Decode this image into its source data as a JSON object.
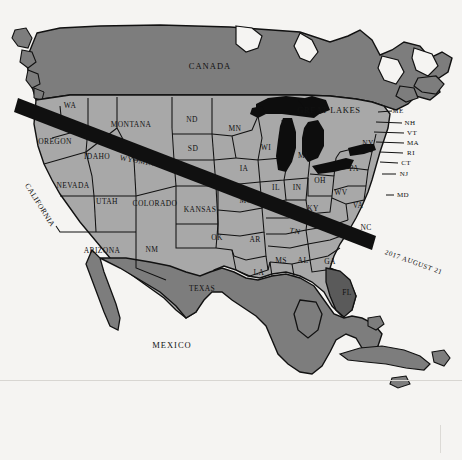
{
  "map": {
    "title": "Total Solar Eclipse Path Across North America",
    "eclipse_path_label": "2017 AUGUST 21",
    "colors": {
      "background": "#f7f6f4",
      "ocean": "#f5f4f2",
      "united_states": "#a8a8a8",
      "canada": "#7d7d7d",
      "mexico": "#7d7d7d",
      "cuba": "#7d7d7d",
      "florida_highlight": "#5a5a5a",
      "great_lakes": "#0d0d0d",
      "eclipse_band": "#101010",
      "border": "#111111",
      "label_text": "#111111"
    },
    "countries": [
      {
        "name": "canada",
        "label": "CANADA"
      },
      {
        "name": "mexico",
        "label": "MEXICO"
      }
    ],
    "features": [
      {
        "name": "great-lakes",
        "label": "GREAT LAKES"
      }
    ],
    "states": [
      {
        "code": "WA",
        "label": "WA",
        "x": 70,
        "y": 105,
        "size": "med"
      },
      {
        "code": "OREGON",
        "label": "OREGON",
        "x": 55,
        "y": 141,
        "size": "med"
      },
      {
        "code": "CALIFORNIA",
        "label": "CALIFORNIA",
        "x": 40,
        "y": 205,
        "size": "med"
      },
      {
        "code": "NEVADA",
        "label": "NEVADA",
        "x": 73,
        "y": 185,
        "size": "med"
      },
      {
        "code": "IDAHO",
        "label": "IDAHO",
        "x": 97,
        "y": 156,
        "size": "med"
      },
      {
        "code": "MONTANA",
        "label": "MONTANA",
        "x": 131,
        "y": 124,
        "size": "med"
      },
      {
        "code": "WYOMING",
        "label": "WYOMING",
        "x": 140,
        "y": 161,
        "size": "med"
      },
      {
        "code": "UTAH",
        "label": "UTAH",
        "x": 107,
        "y": 201,
        "size": "med"
      },
      {
        "code": "COLORADO",
        "label": "COLORADO",
        "x": 155,
        "y": 203,
        "size": "med"
      },
      {
        "code": "ARIZONA",
        "label": "ARIZONA",
        "x": 102,
        "y": 250,
        "size": "med"
      },
      {
        "code": "NM",
        "label": "NM",
        "x": 152,
        "y": 249,
        "size": "med"
      },
      {
        "code": "TEXAS",
        "label": "TEXAS",
        "x": 202,
        "y": 288,
        "size": "med"
      },
      {
        "code": "ND",
        "label": "ND",
        "x": 192,
        "y": 119,
        "size": "med"
      },
      {
        "code": "SD",
        "label": "SD",
        "x": 193,
        "y": 148,
        "size": "med"
      },
      {
        "code": "NEBRASKA",
        "label": "NEBRASKA",
        "x": 196,
        "y": 175,
        "size": "med"
      },
      {
        "code": "KANSAS",
        "label": "KANSAS",
        "x": 200,
        "y": 209,
        "size": "med"
      },
      {
        "code": "OK",
        "label": "OK",
        "x": 217,
        "y": 237,
        "size": "med"
      },
      {
        "code": "MN",
        "label": "MN",
        "x": 235,
        "y": 128,
        "size": "med"
      },
      {
        "code": "IA",
        "label": "IA",
        "x": 244,
        "y": 168,
        "size": "med"
      },
      {
        "code": "MO",
        "label": "MO",
        "x": 246,
        "y": 200,
        "size": "med"
      },
      {
        "code": "AR",
        "label": "AR",
        "x": 255,
        "y": 239,
        "size": "med"
      },
      {
        "code": "LA",
        "label": "LA",
        "x": 259,
        "y": 272,
        "size": "med"
      },
      {
        "code": "MS",
        "label": "MS",
        "x": 281,
        "y": 260,
        "size": "med"
      },
      {
        "code": "AL",
        "label": "AL",
        "x": 303,
        "y": 260,
        "size": "med"
      },
      {
        "code": "GA",
        "label": "GA",
        "x": 330,
        "y": 261,
        "size": "med"
      },
      {
        "code": "WI",
        "label": "WI",
        "x": 266,
        "y": 147,
        "size": "med"
      },
      {
        "code": "IL",
        "label": "IL",
        "x": 276,
        "y": 187,
        "size": "med"
      },
      {
        "code": "MI",
        "label": "MI",
        "x": 303,
        "y": 155,
        "size": "med"
      },
      {
        "code": "IN",
        "label": "IN",
        "x": 297,
        "y": 187,
        "size": "med"
      },
      {
        "code": "OH",
        "label": "OH",
        "x": 320,
        "y": 180,
        "size": "med"
      },
      {
        "code": "KY",
        "label": "KY",
        "x": 313,
        "y": 208,
        "size": "med"
      },
      {
        "code": "TN",
        "label": "TN",
        "x": 295,
        "y": 231,
        "size": "med"
      },
      {
        "code": "WV",
        "label": "WV",
        "x": 341,
        "y": 192,
        "size": "med"
      },
      {
        "code": "VA",
        "label": "VA",
        "x": 358,
        "y": 205,
        "size": "med"
      },
      {
        "code": "NC",
        "label": "NC",
        "x": 366,
        "y": 227,
        "size": "med"
      },
      {
        "code": "PA",
        "label": "PA",
        "x": 354,
        "y": 168,
        "size": "med"
      },
      {
        "code": "NY",
        "label": "NY",
        "x": 368,
        "y": 143,
        "size": "med"
      },
      {
        "code": "FL",
        "label": "FL",
        "x": 347,
        "y": 292,
        "size": "med"
      }
    ],
    "callout_states": [
      {
        "code": "ME",
        "label": "ME",
        "x": 398,
        "y": 111
      },
      {
        "code": "NH",
        "label": "NH",
        "x": 408,
        "y": 123
      },
      {
        "code": "VT",
        "label": "VT",
        "x": 410,
        "y": 133
      },
      {
        "code": "MA",
        "label": "MA",
        "x": 411,
        "y": 143
      },
      {
        "code": "RI",
        "label": "RI",
        "x": 409,
        "y": 153
      },
      {
        "code": "CT",
        "label": "CT",
        "x": 404,
        "y": 163
      },
      {
        "code": "NJ",
        "label": "NJ",
        "x": 402,
        "y": 174
      },
      {
        "code": "MD",
        "label": "MD",
        "x": 400,
        "y": 195
      }
    ]
  }
}
